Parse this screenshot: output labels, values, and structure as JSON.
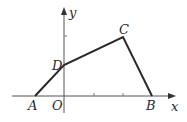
{
  "figure": {
    "type": "coordinate-geometry",
    "axes": {
      "x_label": "x",
      "y_label": "y",
      "origin_label": "O"
    },
    "points": [
      {
        "label": "A",
        "location": "negative x-axis"
      },
      {
        "label": "D",
        "location": "positive y-axis"
      },
      {
        "label": "C",
        "location": "first quadrant"
      },
      {
        "label": "B",
        "location": "positive x-axis"
      }
    ],
    "polyline": [
      "A",
      "D",
      "C",
      "B"
    ],
    "colors": {
      "stroke": "#2a2a2a",
      "axis": "#555555",
      "background": "#ffffff"
    }
  }
}
